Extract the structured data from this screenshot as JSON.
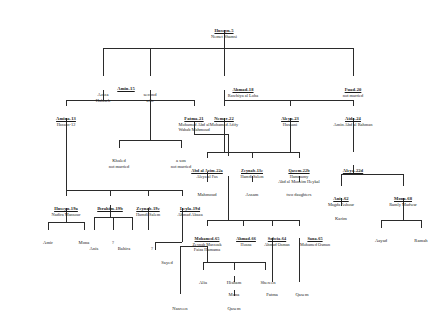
{
  "diagram": {
    "type": "genealogical-tree",
    "line_color": "#2b2b2b",
    "background": "#ffffff"
  },
  "people": [
    {
      "id": "huseyn5",
      "name": "Huseyn-5",
      "spouse": "Nemet Shamsi",
      "spouse2": ""
    },
    {
      "id": "amin15",
      "name": "Amin-15",
      "spouse": "",
      "spouse2": ""
    },
    {
      "id": "aziza",
      "name": "Aziza",
      "spouse": "Halaseh",
      "spouse2": ""
    },
    {
      "id": "second",
      "name": "second",
      "spouse": "wife",
      "spouse2": ""
    },
    {
      "id": "ahmad18",
      "name": "Ahmad-18",
      "spouse": "Rawhiya al Loha",
      "spouse2": ""
    },
    {
      "id": "fuad20",
      "name": "Fuad-20",
      "spouse": "not married",
      "spouse2": ""
    },
    {
      "id": "amina13",
      "name": "Amina-13",
      "spouse": "Hassan-12",
      "spouse2": ""
    },
    {
      "id": "fatma21",
      "name": "Fatma-21",
      "spouse": "Mohamed Abd al",
      "spouse2": "Wahab Mahmoud"
    },
    {
      "id": "nemer22",
      "name": "Nemer-22",
      "spouse": "Mohamed Afify",
      "spouse2": ""
    },
    {
      "id": "aleya23",
      "name": "Aleya-23",
      "spouse": "Hussani",
      "spouse2": ""
    },
    {
      "id": "aida24",
      "name": "Aida-24",
      "spouse": "Amin Abd al Rahman",
      "spouse2": ""
    },
    {
      "id": "khaled",
      "name": "Khaled",
      "spouse": "not married",
      "spouse2": ""
    },
    {
      "id": "ason",
      "name": "a son",
      "spouse": "not married",
      "spouse2": ""
    },
    {
      "id": "abdalazim",
      "name": "Abd al Azim-22a",
      "spouse": "Aleya al Fas",
      "spouse2": ""
    },
    {
      "id": "zeynab13c",
      "name": "Zeynab-13c",
      "spouse": "Hamdi Salem",
      "spouse2": ""
    },
    {
      "id": "qasem22b",
      "name": "Qasem-22b",
      "spouse": "Hammamy",
      "spouse2": "Abd al Moneim Heykal"
    },
    {
      "id": "aleya22d",
      "name": "Aleya-22d",
      "spouse": "",
      "spouse2": ""
    },
    {
      "id": "mahmoud",
      "name": "Mahmoud",
      "spouse": "",
      "spouse2": ""
    },
    {
      "id": "assam",
      "name": "Assam",
      "spouse": "",
      "spouse2": ""
    },
    {
      "id": "twodau",
      "name": "two daughters",
      "spouse": "",
      "spouse2": ""
    },
    {
      "id": "huseyn19a",
      "name": "Huseyn-19a",
      "spouse": "Nadira Mansour",
      "spouse2": ""
    },
    {
      "id": "ibrahim19b",
      "name": "Ibrahim-19b",
      "spouse": "",
      "spouse2": ""
    },
    {
      "id": "zeynab19c",
      "name": "Zeynab-19c",
      "spouse": "Hamdi Salem",
      "spouse2": ""
    },
    {
      "id": "leyla19d",
      "name": "Leyla-19d",
      "spouse": "Ahmad Abaza",
      "spouse2": ""
    },
    {
      "id": "anis62",
      "name": "Anis-62",
      "spouse": "Magda Ashour",
      "spouse2": ""
    },
    {
      "id": "mona68",
      "name": "Mona-68",
      "spouse": "Ramly Madwar",
      "spouse2": ""
    },
    {
      "id": "karim",
      "name": "Karim",
      "spouse": "",
      "spouse2": ""
    },
    {
      "id": "amir",
      "name": "Amir",
      "spouse": "",
      "spouse2": ""
    },
    {
      "id": "mona_l",
      "name": "Mona",
      "spouse": "",
      "spouse2": ""
    },
    {
      "id": "qmark1",
      "name": "?",
      "spouse": "",
      "spouse2": ""
    },
    {
      "id": "anis_b",
      "name": "Anis",
      "spouse": "",
      "spouse2": ""
    },
    {
      "id": "bahira",
      "name": "Bahira",
      "spouse": "",
      "spouse2": ""
    },
    {
      "id": "qmark2",
      "name": "?",
      "spouse": "",
      "spouse2": ""
    },
    {
      "id": "mohamed65",
      "name": "Mohamed-65",
      "spouse": "Zeynab Marzouk",
      "spouse2": "Faiza Hamama"
    },
    {
      "id": "ahmad66",
      "name": "Ahmad-66",
      "spouse": "Hosna",
      "spouse2": ""
    },
    {
      "id": "sobeia64",
      "name": "Sobeia-64",
      "spouse": "Ahmad Osman",
      "spouse2": ""
    },
    {
      "id": "sana65",
      "name": "Sana-65",
      "spouse": "Mohamed Osman",
      "spouse2": ""
    },
    {
      "id": "aayad",
      "name": "Aayad",
      "spouse": "",
      "spouse2": ""
    },
    {
      "id": "ramah",
      "name": "Ramah",
      "spouse": "",
      "spouse2": ""
    },
    {
      "id": "sayed",
      "name": "Sayed",
      "spouse": "",
      "spouse2": ""
    },
    {
      "id": "alia",
      "name": "Alia",
      "spouse": "",
      "spouse2": ""
    },
    {
      "id": "hisham",
      "name": "Hisham",
      "spouse": "",
      "spouse2": ""
    },
    {
      "id": "shereen",
      "name": "Shereen",
      "spouse": "",
      "spouse2": ""
    },
    {
      "id": "monab",
      "name": "Mona",
      "spouse": "",
      "spouse2": ""
    },
    {
      "id": "fatma_b",
      "name": "Fatma",
      "spouse": "",
      "spouse2": ""
    },
    {
      "id": "qasem_b",
      "name": "Qasem",
      "spouse": "",
      "spouse2": ""
    },
    {
      "id": "nasreen",
      "name": "Nasreen",
      "spouse": "",
      "spouse2": ""
    },
    {
      "id": "qasem_c",
      "name": "Qasem",
      "spouse": "",
      "spouse2": ""
    }
  ]
}
